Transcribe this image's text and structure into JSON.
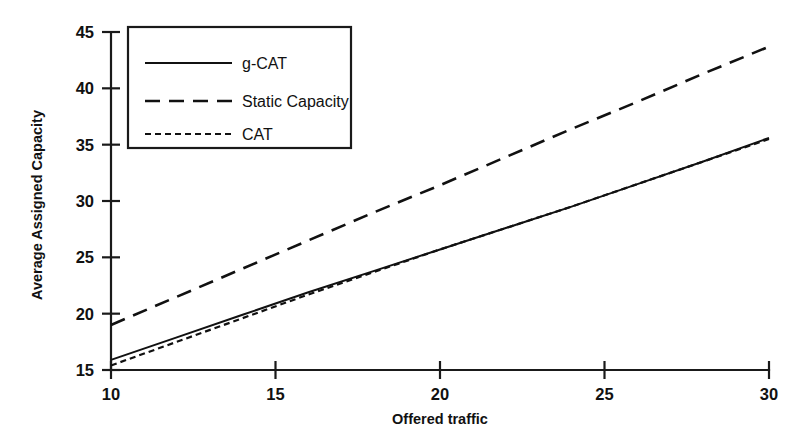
{
  "chart_data": {
    "type": "line",
    "title": "",
    "subtitle": "",
    "xlabel": "Offered traffic",
    "ylabel": "Average Assigned Capacity",
    "xlim": [
      10,
      30
    ],
    "ylim": [
      15,
      45
    ],
    "xticks": [
      10,
      15,
      20,
      25,
      30
    ],
    "yticks": [
      15,
      20,
      25,
      30,
      35,
      40,
      45
    ],
    "xtick_labels": [
      "10",
      "15",
      "20",
      "25",
      "30"
    ],
    "ytick_labels": [
      "15",
      "20",
      "25",
      "30",
      "35",
      "40",
      "45"
    ],
    "grid": false,
    "legend_position": "top-left-inside",
    "x": [
      10,
      12,
      14,
      16,
      18,
      20,
      22,
      24,
      26,
      28,
      30
    ],
    "series": [
      {
        "name": "g-CAT",
        "style": "solid",
        "values": [
          15.9,
          17.9,
          19.9,
          21.9,
          23.8,
          25.7,
          27.6,
          29.5,
          31.5,
          33.5,
          35.6
        ]
      },
      {
        "name": "Static Capacity",
        "style": "long-dash",
        "values": [
          19.0,
          21.5,
          24.0,
          26.5,
          29.0,
          31.4,
          33.9,
          36.4,
          38.8,
          41.3,
          43.7
        ]
      },
      {
        "name": "CAT",
        "style": "short-dash",
        "values": [
          15.4,
          17.5,
          19.6,
          21.7,
          23.7,
          25.7,
          27.6,
          29.5,
          31.5,
          33.5,
          35.5
        ]
      }
    ],
    "annotations": []
  },
  "legend": {
    "entries": [
      {
        "label": "g-CAT",
        "style": "solid"
      },
      {
        "label": "Static Capacity",
        "style": "long-dash"
      },
      {
        "label": "CAT",
        "style": "short-dash"
      }
    ]
  },
  "colors": {
    "background": "#ffffff",
    "ink": "#111111",
    "axis": "#1a1a1a"
  }
}
